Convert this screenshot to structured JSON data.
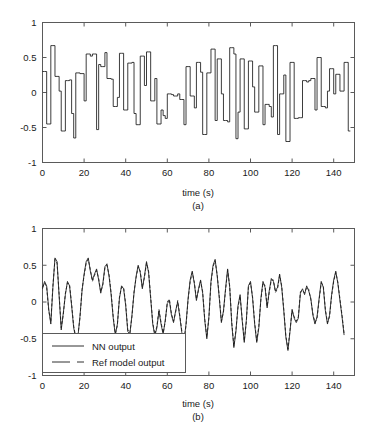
{
  "figure": {
    "background": "#ffffff",
    "axis_color": "#5a5a5a",
    "trace_color": "#1a1a1a"
  },
  "panels": [
    {
      "id": "a",
      "caption": "(a)",
      "xlabel": "time (s)",
      "ylabel": "",
      "xticks": [
        "0",
        "20",
        "40",
        "60",
        "80",
        "100",
        "120",
        "140"
      ],
      "yticks": [
        "1",
        "0.5",
        "0",
        "-0.5",
        "-1"
      ]
    },
    {
      "id": "b",
      "caption": "(b)",
      "xlabel": "time (s)",
      "ylabel": "",
      "xticks": [
        "0",
        "20",
        "40",
        "60",
        "80",
        "100",
        "120",
        "140"
      ],
      "yticks": [
        "1",
        "0.5",
        "0",
        "-0.5",
        "-1"
      ],
      "legend": {
        "entries": [
          {
            "label": "NN output",
            "style": "solid"
          },
          {
            "label": "Ref model output",
            "style": "dashed"
          }
        ]
      }
    }
  ],
  "chart_data": [
    {
      "type": "line",
      "subplot": "a",
      "title": "",
      "xlabel": "time (s)",
      "ylabel": "",
      "xlim": [
        0,
        150
      ],
      "ylim": [
        -1,
        1
      ],
      "xticks": [
        0,
        20,
        40,
        60,
        80,
        100,
        120,
        140
      ],
      "yticks": [
        -1,
        -0.5,
        0,
        0.5,
        1
      ],
      "grid": false,
      "legend": null,
      "interpolation": "zero-order-hold",
      "series": [
        {
          "name": "reference input",
          "style": "solid",
          "color": "#1a1a1a",
          "x": [
            0,
            1,
            2,
            3,
            4,
            5,
            6,
            7,
            8,
            9,
            10,
            11,
            12,
            13,
            14,
            15,
            16,
            17,
            18,
            19,
            20,
            21,
            22,
            23,
            24,
            25,
            26,
            27,
            28,
            29,
            30,
            31,
            32,
            33,
            34,
            35,
            36,
            37,
            38,
            39,
            40,
            41,
            42,
            43,
            44,
            45,
            46,
            47,
            48,
            49,
            50,
            51,
            52,
            53,
            54,
            55,
            56,
            57,
            58,
            59,
            60,
            61,
            62,
            63,
            64,
            65,
            66,
            67,
            68,
            69,
            70,
            71,
            72,
            73,
            74,
            75,
            76,
            77,
            78,
            79,
            80,
            81,
            82,
            83,
            84,
            85,
            86,
            87,
            88,
            89,
            90,
            91,
            92,
            93,
            94,
            95,
            96,
            97,
            98,
            99,
            100,
            101,
            102,
            103,
            104,
            105,
            106,
            107,
            108,
            109,
            110,
            111,
            112,
            113,
            114,
            115,
            116,
            117,
            118,
            119,
            120,
            121,
            122,
            123,
            124,
            125,
            126,
            127,
            128,
            129,
            130,
            131,
            132,
            133,
            134,
            135,
            136,
            137,
            138,
            139,
            140,
            141,
            142,
            143,
            144,
            145,
            146,
            147,
            148,
            149,
            150
          ],
          "values": [
            0.3,
            0.3,
            -0.45,
            -0.45,
            0.67,
            0.67,
            0.23,
            0.23,
            0.02,
            -0.55,
            -0.55,
            0.17,
            0.17,
            0.18,
            -0.3,
            -0.65,
            0.28,
            0.28,
            0.27,
            0.27,
            -0.12,
            0.55,
            0.55,
            0.52,
            0.55,
            0.55,
            -0.53,
            0.4,
            0.37,
            0.37,
            0.57,
            0.2,
            0.2,
            0.19,
            -0.2,
            -0.2,
            -0.07,
            0.56,
            0.56,
            -0.25,
            -0.25,
            0.42,
            0.42,
            0.43,
            -0.3,
            -0.46,
            -0.46,
            0.52,
            0.52,
            0.1,
            0.58,
            0.58,
            -0.12,
            -0.12,
            0.2,
            -0.45,
            -0.45,
            -0.25,
            -0.33,
            -0.37,
            -0.02,
            -0.02,
            -0.03,
            -0.05,
            -0.05,
            -0.02,
            -0.1,
            -0.1,
            -0.46,
            0.37,
            0.37,
            -0.05,
            -0.05,
            -0.22,
            0.43,
            0.43,
            0.29,
            -0.6,
            -0.6,
            0.28,
            0.28,
            0.62,
            0.62,
            -0.4,
            0.48,
            0.48,
            -0.02,
            -0.4,
            -0.4,
            -0.42,
            0.64,
            0.64,
            0.55,
            -0.66,
            -0.28,
            0.48,
            0.48,
            -0.52,
            -0.52,
            0.45,
            0.45,
            0.08,
            -0.28,
            -0.28,
            0.38,
            0.38,
            -0.46,
            -0.17,
            -0.17,
            -0.2,
            -0.35,
            0.67,
            0.67,
            -0.6,
            -0.02,
            -0.02,
            0.25,
            -0.7,
            -0.7,
            0.43,
            0.43,
            -0.37,
            -0.37,
            -0.36,
            -0.36,
            0.17,
            0.17,
            0.15,
            0.17,
            0.2,
            0.2,
            -0.25,
            0.5,
            0.5,
            -0.2,
            -0.2,
            -0.22,
            0.02,
            0.34,
            0.34,
            -0.02,
            0.26,
            0.26,
            0.02,
            0.02,
            0.43,
            0.43,
            -0.55
          ]
        }
      ]
    },
    {
      "type": "line",
      "subplot": "b",
      "title": "",
      "xlabel": "time (s)",
      "ylabel": "",
      "xlim": [
        0,
        150
      ],
      "ylim": [
        -1,
        1
      ],
      "xticks": [
        0,
        20,
        40,
        60,
        80,
        100,
        120,
        140
      ],
      "yticks": [
        -1,
        -0.5,
        0,
        0.5,
        1
      ],
      "grid": false,
      "legend_position": "lower left",
      "series": [
        {
          "name": "NN output",
          "style": "solid",
          "color": "#1a1a1a",
          "x": [
            0,
            1,
            2,
            3,
            4,
            5,
            6,
            7,
            8,
            9,
            10,
            11,
            12,
            13,
            14,
            15,
            16,
            17,
            18,
            19,
            20,
            21,
            22,
            23,
            24,
            25,
            26,
            27,
            28,
            29,
            30,
            31,
            32,
            33,
            34,
            35,
            36,
            37,
            38,
            39,
            40,
            41,
            42,
            43,
            44,
            45,
            46,
            47,
            48,
            49,
            50,
            51,
            52,
            53,
            54,
            55,
            56,
            57,
            58,
            59,
            60,
            61,
            62,
            63,
            64,
            65,
            66,
            67,
            68,
            69,
            70,
            71,
            72,
            73,
            74,
            75,
            76,
            77,
            78,
            79,
            80,
            81,
            82,
            83,
            84,
            85,
            86,
            87,
            88,
            89,
            90,
            91,
            92,
            93,
            94,
            95,
            96,
            97,
            98,
            99,
            100,
            101,
            102,
            103,
            104,
            105,
            106,
            107,
            108,
            109,
            110,
            111,
            112,
            113,
            114,
            115,
            116,
            117,
            118,
            119,
            120,
            121,
            122,
            123,
            124,
            125,
            126,
            127,
            128,
            129,
            130,
            131,
            132,
            133,
            134,
            135,
            136,
            137,
            138,
            139,
            140,
            141,
            142,
            143,
            144,
            145,
            146,
            147,
            148,
            149,
            150
          ],
          "values": [
            0.18,
            0.28,
            0.22,
            -0.1,
            -0.3,
            0.2,
            0.6,
            0.55,
            0.08,
            -0.38,
            -0.15,
            0.1,
            0.28,
            0.22,
            -0.05,
            -0.35,
            -0.5,
            -0.48,
            -0.2,
            0.15,
            0.38,
            0.55,
            0.6,
            0.42,
            0.3,
            0.38,
            0.45,
            0.3,
            0.12,
            0.25,
            0.48,
            0.52,
            0.35,
            0.1,
            -0.22,
            -0.45,
            -0.3,
            0.05,
            0.22,
            0.18,
            -0.05,
            -0.4,
            -0.44,
            -0.18,
            0.12,
            0.35,
            0.5,
            0.4,
            0.18,
            0.35,
            0.55,
            0.4,
            0.05,
            -0.3,
            -0.46,
            -0.35,
            -0.12,
            -0.3,
            -0.44,
            -0.25,
            -0.02,
            0.02,
            -0.18,
            -0.28,
            -0.12,
            0.0,
            -0.2,
            -0.42,
            -0.55,
            -0.3,
            0.05,
            0.3,
            0.42,
            0.25,
            0.02,
            0.18,
            0.3,
            0.12,
            -0.25,
            -0.5,
            -0.2,
            0.28,
            0.5,
            0.58,
            0.35,
            0.05,
            -0.28,
            -0.12,
            0.18,
            0.45,
            0.2,
            -0.3,
            -0.62,
            -0.4,
            -0.05,
            0.1,
            -0.25,
            -0.55,
            -0.25,
            0.22,
            0.28,
            0.05,
            -0.3,
            -0.55,
            -0.35,
            0.05,
            0.28,
            0.2,
            -0.08,
            0.15,
            0.32,
            0.28,
            0.15,
            0.2,
            0.38,
            0.2,
            -0.12,
            -0.48,
            -0.66,
            -0.4,
            -0.1,
            -0.22,
            -0.28,
            -0.22,
            0.12,
            0.18,
            0.1,
            0.22,
            0.15,
            0.05,
            -0.18,
            -0.3,
            -0.2,
            0.05,
            0.28,
            0.2,
            -0.12,
            -0.3,
            -0.18,
            0.1,
            0.3,
            0.42,
            0.25,
            0.02,
            -0.2,
            -0.45
          ]
        },
        {
          "name": "Ref model output",
          "style": "dashed",
          "color": "#1a1a1a",
          "x": [
            0,
            1,
            2,
            3,
            4,
            5,
            6,
            7,
            8,
            9,
            10,
            11,
            12,
            13,
            14,
            15,
            16,
            17,
            18,
            19,
            20,
            21,
            22,
            23,
            24,
            25,
            26,
            27,
            28,
            29,
            30,
            31,
            32,
            33,
            34,
            35,
            36,
            37,
            38,
            39,
            40,
            41,
            42,
            43,
            44,
            45,
            46,
            47,
            48,
            49,
            50,
            51,
            52,
            53,
            54,
            55,
            56,
            57,
            58,
            59,
            60,
            61,
            62,
            63,
            64,
            65,
            66,
            67,
            68,
            69,
            70,
            71,
            72,
            73,
            74,
            75,
            76,
            77,
            78,
            79,
            80,
            81,
            82,
            83,
            84,
            85,
            86,
            87,
            88,
            89,
            90,
            91,
            92,
            93,
            94,
            95,
            96,
            97,
            98,
            99,
            100,
            101,
            102,
            103,
            104,
            105,
            106,
            107,
            108,
            109,
            110,
            111,
            112,
            113,
            114,
            115,
            116,
            117,
            118,
            119,
            120,
            121,
            122,
            123,
            124,
            125,
            126,
            127,
            128,
            129,
            130,
            131,
            132,
            133,
            134,
            135,
            136,
            137,
            138,
            139,
            140,
            141,
            142,
            143,
            144,
            145,
            146,
            147,
            148,
            149,
            150
          ],
          "values": [
            0.2,
            0.26,
            0.2,
            -0.12,
            -0.27,
            0.22,
            0.58,
            0.53,
            0.1,
            -0.35,
            -0.17,
            0.12,
            0.26,
            0.24,
            -0.03,
            -0.33,
            -0.48,
            -0.46,
            -0.22,
            0.17,
            0.36,
            0.53,
            0.58,
            0.44,
            0.28,
            0.36,
            0.43,
            0.32,
            0.14,
            0.23,
            0.46,
            0.5,
            0.37,
            0.12,
            -0.2,
            -0.43,
            -0.32,
            0.07,
            0.2,
            0.2,
            -0.03,
            -0.38,
            -0.42,
            -0.2,
            0.14,
            0.33,
            0.48,
            0.42,
            0.2,
            0.33,
            0.53,
            0.42,
            0.07,
            -0.28,
            -0.44,
            -0.33,
            -0.1,
            -0.28,
            -0.42,
            -0.27,
            0.0,
            0.04,
            -0.16,
            -0.26,
            -0.14,
            0.02,
            -0.18,
            -0.4,
            -0.53,
            -0.32,
            0.03,
            0.28,
            0.4,
            0.27,
            0.04,
            0.16,
            0.28,
            0.14,
            -0.23,
            -0.48,
            -0.22,
            0.26,
            0.48,
            0.56,
            0.37,
            0.07,
            -0.26,
            -0.14,
            0.16,
            0.43,
            0.22,
            -0.28,
            -0.6,
            -0.38,
            -0.07,
            0.08,
            -0.23,
            -0.53,
            -0.27,
            0.2,
            0.26,
            0.07,
            -0.28,
            -0.53,
            -0.33,
            0.03,
            0.26,
            0.22,
            -0.06,
            0.13,
            0.3,
            0.3,
            0.13,
            0.18,
            0.36,
            0.22,
            -0.1,
            -0.46,
            -0.64,
            -0.38,
            -0.12,
            -0.2,
            -0.26,
            -0.2,
            0.14,
            0.16,
            0.12,
            0.2,
            0.17,
            0.03,
            -0.16,
            -0.28,
            -0.22,
            0.03,
            0.26,
            0.22,
            -0.1,
            -0.28,
            -0.2,
            0.08,
            0.28,
            0.4,
            0.27,
            0.04,
            -0.18,
            -0.43
          ]
        }
      ]
    }
  ]
}
